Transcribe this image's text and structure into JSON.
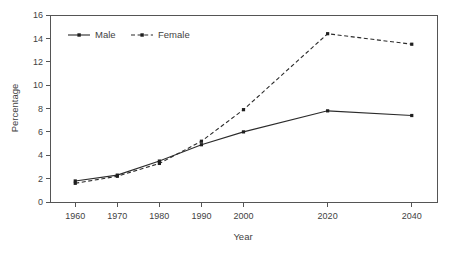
{
  "chart_data": {
    "type": "line",
    "title": "",
    "xlabel": "Year",
    "ylabel": "Percentage",
    "x": [
      1960,
      1970,
      1980,
      1990,
      2000,
      2020,
      2040
    ],
    "categories": [
      "1960",
      "1970",
      "1980",
      "1990",
      "2000",
      "2020",
      "2040"
    ],
    "xlim": [
      1954,
      2046
    ],
    "ylim": [
      0,
      16
    ],
    "xticks": [
      1960,
      1970,
      1980,
      1990,
      2000,
      2020,
      2040
    ],
    "yticks": [
      0,
      2,
      4,
      6,
      8,
      10,
      12,
      14,
      16
    ],
    "xtick_labels": [
      "1960",
      "1970",
      "1980",
      "1990",
      "2000",
      "2020",
      "2040"
    ],
    "ytick_labels": [
      "0",
      "2",
      "4",
      "6",
      "8",
      "10",
      "12",
      "14",
      "16"
    ],
    "grid": false,
    "legend_position": "top-left-inside",
    "series": [
      {
        "name": "Male",
        "style": "solid",
        "marker": "small-square",
        "color": "#2b2b2b",
        "values": [
          1.8,
          2.3,
          3.5,
          4.9,
          6.0,
          7.8,
          7.4
        ]
      },
      {
        "name": "Female",
        "style": "dashed",
        "marker": "small-square",
        "color": "#2b2b2b",
        "values": [
          1.6,
          2.2,
          3.3,
          5.2,
          7.9,
          14.4,
          13.5
        ]
      }
    ]
  },
  "axes": {
    "y_title": "Percentage",
    "x_title": "Year"
  },
  "legend": {
    "items": [
      {
        "label": "Male"
      },
      {
        "label": "Female"
      }
    ]
  },
  "colors": {
    "line": "#2b2b2b",
    "axis": "#555555",
    "text": "#3f3f3f",
    "background": "#ffffff"
  }
}
